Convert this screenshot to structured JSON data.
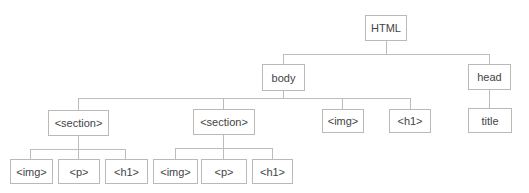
{
  "diagram": {
    "type": "tree",
    "title": "",
    "nodes": {
      "html": "HTML",
      "body": "body",
      "head": "head",
      "section1": "<section>",
      "section2": "<section>",
      "body_img": "<img>",
      "body_h1": "<h1>",
      "title": "title",
      "s1_img": "<img>",
      "s1_p": "<p>",
      "s1_h1": "<h1>",
      "s2_img": "<img>",
      "s2_p": "<p>",
      "s2_h1": "<h1>"
    },
    "edges": [
      [
        "HTML",
        "body"
      ],
      [
        "HTML",
        "head"
      ],
      [
        "body",
        "<section>#1"
      ],
      [
        "body",
        "<section>#2"
      ],
      [
        "body",
        "<img>"
      ],
      [
        "body",
        "<h1>"
      ],
      [
        "head",
        "title"
      ],
      [
        "<section>#1",
        "<img>"
      ],
      [
        "<section>#1",
        "<p>"
      ],
      [
        "<section>#1",
        "<h1>"
      ],
      [
        "<section>#2",
        "<img>"
      ],
      [
        "<section>#2",
        "<p>"
      ],
      [
        "<section>#2",
        "<h1>"
      ]
    ]
  }
}
